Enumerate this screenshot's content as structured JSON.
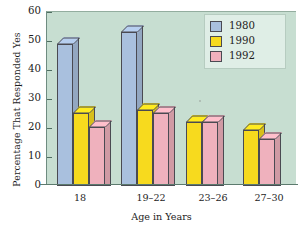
{
  "chart_data": {
    "type": "bar",
    "title": "",
    "xlabel": "Age in Years",
    "ylabel": "Percentage That Responded Yes",
    "categories": [
      "18",
      "19–22",
      "23–26",
      "27–30"
    ],
    "series": [
      {
        "name": "1980",
        "color": "#a9c0de",
        "values": [
          49,
          53,
          null,
          null
        ]
      },
      {
        "name": "1990",
        "color": "#f7da1e",
        "values": [
          25,
          26,
          22,
          19
        ]
      },
      {
        "name": "1992",
        "color": "#efb1bd",
        "values": [
          20,
          25,
          22,
          16
        ]
      }
    ],
    "yticks": [
      0,
      10,
      20,
      30,
      40,
      50,
      60
    ],
    "ylim": [
      0,
      60
    ],
    "grid": false,
    "legend_position": "top-right",
    "plot_background": "#c7ded1"
  },
  "legend": {
    "entries": [
      {
        "label": "1980",
        "color": "#a9c0de"
      },
      {
        "label": "1990",
        "color": "#f7da1e"
      },
      {
        "label": "1992",
        "color": "#efb1bd"
      }
    ]
  },
  "axes": {
    "y_title": "Percentage That Responded Yes",
    "x_title": "Age in Years",
    "y_tick_labels": [
      "60",
      "50",
      "40",
      "30",
      "20",
      "10",
      "0"
    ],
    "x_tick_labels": [
      "18",
      "19–22",
      "23–26",
      "27–30"
    ]
  }
}
